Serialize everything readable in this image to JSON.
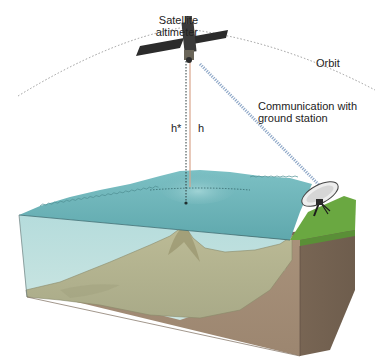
{
  "diagram": {
    "labels": {
      "satellite_line1": "Satellite",
      "satellite_line2": "altimeter",
      "orbit": "Orbit",
      "comm_line1": "Communication with",
      "comm_line2": "ground station",
      "h_star": "h*",
      "h": "h"
    },
    "colors": {
      "sea_surface": "#6fb3b8",
      "water_body": "#bfe0df",
      "seafloor": "#b7b792",
      "crust_front": "#a58f78",
      "crust_side": "#7d6a58",
      "land_grass": "#6aa841",
      "orbit_line": "#9a9a9a",
      "height_line": "#d8a48c",
      "signal_beam": "#8fa8c8",
      "satellite_body": "#2b2b2b"
    }
  }
}
